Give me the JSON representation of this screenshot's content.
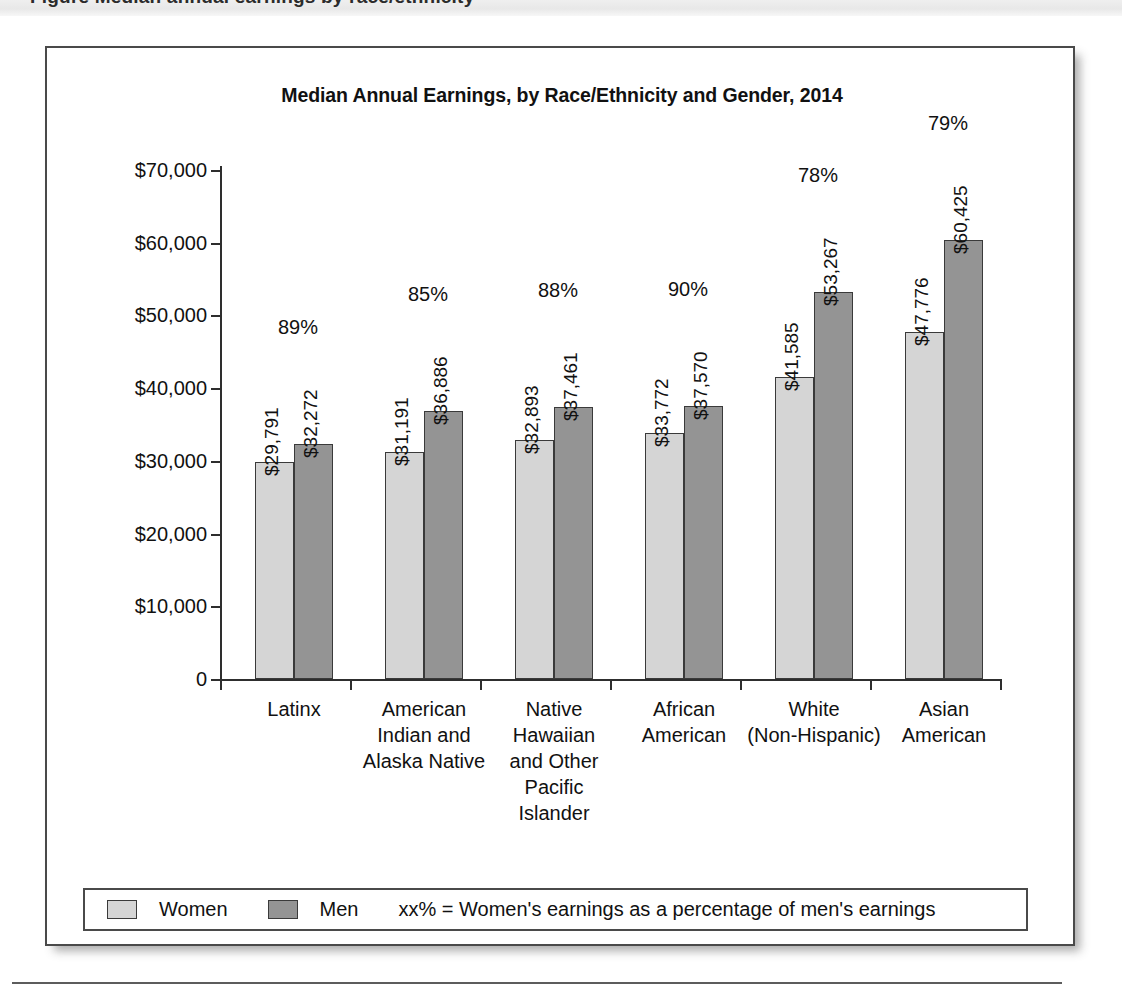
{
  "page": {
    "top_band_ghost_text": "Figure  Median annual earnings by race/ethnicity"
  },
  "figure": {
    "title": "Median Annual Earnings, by Race/Ethnicity and Gender, 2014"
  },
  "legend": {
    "women_label": "Women",
    "men_label": "Men",
    "note": "xx% = Women's earnings as a percentage of men's earnings"
  },
  "chart_data": {
    "type": "bar",
    "title": "Median Annual Earnings, by Race/Ethnicity and Gender, 2014",
    "xlabel": "",
    "ylabel": "",
    "ylim": [
      0,
      70000
    ],
    "grid": false,
    "legend_position": "bottom",
    "ytick_labels": [
      "$70,000",
      "$60,000",
      "$50,000",
      "$40,000",
      "$30,000",
      "$20,000",
      "$10,000",
      "0"
    ],
    "ytick_values": [
      70000,
      60000,
      50000,
      40000,
      30000,
      20000,
      10000,
      0
    ],
    "categories": [
      "Latinx",
      "American\nIndian and\nAlaska Native",
      "Native\nHawaiian\nand Other\nPacific\nIslander",
      "African\nAmerican",
      "White\n(Non-Hispanic)",
      "Asian\nAmerican"
    ],
    "series": [
      {
        "name": "Women",
        "color": "#d5d5d5",
        "values": [
          29791,
          31191,
          32893,
          33772,
          41585,
          47776
        ],
        "labels": [
          "$29,791",
          "$31,191",
          "$32,893",
          "$33,772",
          "$41,585",
          "$47,776"
        ]
      },
      {
        "name": "Men",
        "color": "#949494",
        "values": [
          32272,
          36886,
          37461,
          37570,
          53267,
          60425
        ],
        "labels": [
          "$32,272",
          "$36,886",
          "$37,461",
          "$37,570",
          "$53,267",
          "$60,425"
        ]
      }
    ],
    "annotations": {
      "ratio_labels": [
        "89%",
        "85%",
        "88%",
        "90%",
        "78%",
        "79%"
      ],
      "ratio_meaning": "xx% = Women's earnings as a percentage of men's earnings"
    }
  }
}
